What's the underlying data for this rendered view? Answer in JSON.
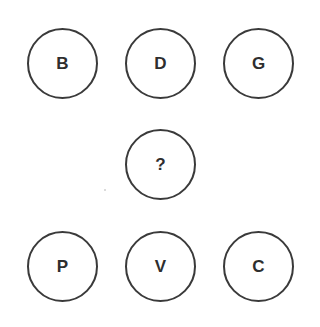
{
  "puzzle": {
    "top_row": [
      {
        "letter": "B"
      },
      {
        "letter": "D"
      },
      {
        "letter": "G"
      }
    ],
    "middle": {
      "letter": "?"
    },
    "bottom_row": [
      {
        "letter": "P"
      },
      {
        "letter": "V"
      },
      {
        "letter": "C"
      }
    ]
  },
  "colors": {
    "stroke": "#3a3a3a",
    "text": "#2e2e2e",
    "background": "#ffffff"
  }
}
